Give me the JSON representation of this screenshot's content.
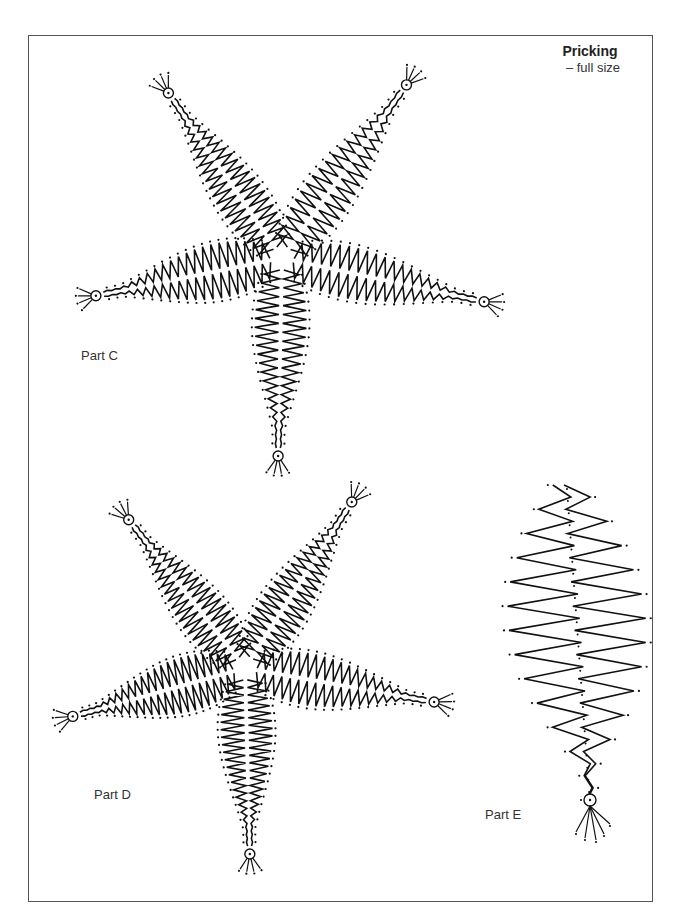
{
  "header": {
    "title": "Pricking",
    "subtitle": "– full size"
  },
  "parts": [
    {
      "id": "C",
      "label": "Part C",
      "label_pos": [
        81,
        356
      ],
      "center": [
        282,
        258
      ],
      "arms": [
        {
          "tip": [
            165,
            88
          ],
          "width": 26,
          "zigs": 22
        },
        {
          "tip": [
            410,
            80
          ],
          "width": 26,
          "zigs": 20
        },
        {
          "tip": [
            90,
            297
          ],
          "width": 30,
          "zigs": 20
        },
        {
          "tip": [
            490,
            303
          ],
          "width": 28,
          "zigs": 20
        },
        {
          "tip": [
            278,
            462
          ],
          "width": 28,
          "zigs": 20
        }
      ]
    },
    {
      "id": "D",
      "label": "Part D",
      "label_pos": [
        94,
        795
      ],
      "center": [
        245,
        668
      ],
      "arms": [
        {
          "tip": [
            125,
            515
          ],
          "width": 26,
          "zigs": 22
        },
        {
          "tip": [
            355,
            497
          ],
          "width": 26,
          "zigs": 22
        },
        {
          "tip": [
            67,
            718
          ],
          "width": 30,
          "zigs": 22
        },
        {
          "tip": [
            440,
            703
          ],
          "width": 28,
          "zigs": 20
        },
        {
          "tip": [
            250,
            860
          ],
          "width": 28,
          "zigs": 22
        }
      ]
    },
    {
      "id": "E",
      "label": "Part E",
      "label_pos": [
        485,
        815
      ],
      "top": [
        567,
        485
      ],
      "bottom": [
        590,
        800
      ],
      "max_width": 130,
      "zigs": 26
    }
  ],
  "colors": {
    "ink": "#111111",
    "frame": "#555555",
    "text": "#333333"
  }
}
